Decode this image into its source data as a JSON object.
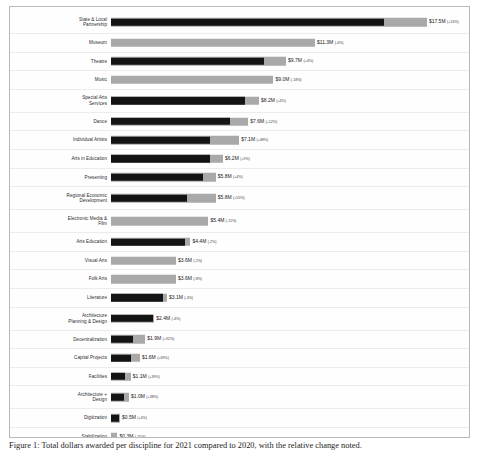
{
  "chart_data": {
    "type": "bar",
    "orientation": "horizontal",
    "title": "",
    "xlabel": "",
    "ylabel": "",
    "xlim": [
      0,
      19.5
    ],
    "grid": true,
    "legend": false,
    "value_prefix": "$",
    "value_suffix": "M",
    "categories": [
      "State & Local\nPartnership",
      "Museum",
      "Theatre",
      "Music",
      "Special Arts\nServices",
      "Dance",
      "Individual Artists",
      "Arts in Education",
      "Presenting",
      "Regional Economic\nDevelopment",
      "Electronic Media &\nFilm",
      "Arts Education",
      "Visual Arts",
      "Folk Arts",
      "Literature",
      "Architecture\nPlanning & Design",
      "Decentralization",
      "Capital Projects",
      "Facilities",
      "Architecture +\nDesign",
      "Digitization",
      "Stabilization",
      "Capital Aid",
      "Stimulus"
    ],
    "series": [
      {
        "name": "Current",
        "values": [
          17.5,
          11.3,
          9.7,
          9.0,
          8.2,
          7.6,
          7.1,
          6.2,
          5.8,
          5.8,
          5.4,
          4.4,
          3.6,
          3.6,
          3.1,
          2.4,
          1.9,
          1.6,
          1.1,
          1.0,
          0.5,
          0.3,
          0.3,
          0.1
        ]
      },
      {
        "name": "Baseline",
        "values": [
          15.1,
          11.3,
          8.5,
          9.0,
          7.4,
          6.6,
          5.5,
          5.5,
          5.1,
          4.2,
          5.4,
          4.1,
          3.6,
          3.6,
          2.9,
          2.3,
          1.2,
          1.1,
          0.8,
          0.7,
          0.45,
          0.36,
          0.15,
          0.03
        ]
      }
    ],
    "value_labels": [
      "$17.5M",
      "$11.3M",
      "$9.7M",
      "$9.0M",
      "$8.2M",
      "$7.6M",
      "$7.1M",
      "$6.2M",
      "$5.8M",
      "$5.8M",
      "$5.4M",
      "$4.4M",
      "$3.6M",
      "$3.6M",
      "$3.1M",
      "$2.4M",
      "$1.9M",
      "$1.6M",
      "$1.1M",
      "$1.0M",
      "$0.5M",
      "$0.3M",
      "$0.3M",
      "$0.1M"
    ],
    "percent_labels": [
      "(+14%)",
      "(-4%)",
      "(+4%)",
      "(-18%)",
      "(+4%)",
      "(+12%)",
      "(+48%)",
      "(+9%)",
      "(+4%)",
      "(+55%)",
      "(-11%)",
      "(-2%)",
      "(-2%)",
      "(-8%)",
      "(-4%)",
      "(-4%)",
      "(+92%)",
      "(+69%)",
      "(+39%)",
      "(+38%)",
      "(+4%)",
      "(-25%)",
      "(+88%)",
      "(+160%)"
    ],
    "bar_styles": [
      "dual",
      "base",
      "dual",
      "base",
      "dual",
      "dual",
      "dual",
      "dual",
      "dual",
      "dual",
      "base",
      "dual",
      "base",
      "base",
      "dual",
      "dual",
      "dual",
      "dual",
      "dual",
      "dual",
      "dual",
      "base",
      "dual",
      "dual"
    ],
    "colors": {
      "bar_base": "#a9a9a9",
      "bar_overlay": "#141414",
      "gridline": "#ececec",
      "frame_border": "#b9b9b9",
      "label_text": "#2c2c2c",
      "value_text": "#1a1a1a",
      "background": "#ffffff"
    }
  },
  "caption": {
    "text": "Figure 1: Total dollars awarded per discipline for 2021 compared to 2020, with the relative change noted."
  }
}
